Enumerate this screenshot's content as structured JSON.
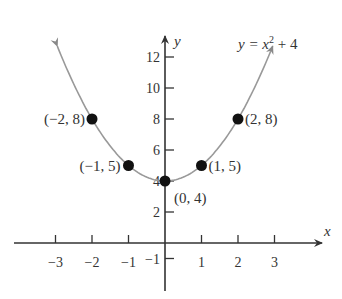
{
  "chart_data": {
    "type": "line",
    "title": "",
    "equation": "y = x^2 + 4",
    "equation_parts": {
      "lhs": "y",
      "eq": "=",
      "var": "x",
      "exp": "2",
      "rest": "+ 4"
    },
    "xlabel": "x",
    "ylabel": "y",
    "xlim": [
      -3.5,
      3.5
    ],
    "ylim": [
      -1.5,
      13
    ],
    "x_ticks": [
      -3,
      -2,
      -1,
      1,
      2,
      3
    ],
    "x_tick_labels": [
      "−3",
      "−2",
      "−1",
      "1",
      "2",
      "3"
    ],
    "y_ticks": [
      -1,
      2,
      4,
      6,
      8,
      10,
      12
    ],
    "y_tick_labels": [
      "−1",
      "2",
      "4",
      "6",
      "8",
      "10",
      "12"
    ],
    "grid": false,
    "points": [
      {
        "x": -2,
        "y": 8,
        "label": "(−2, 8)"
      },
      {
        "x": -1,
        "y": 5,
        "label": "(−1, 5)"
      },
      {
        "x": 0,
        "y": 4,
        "label": "(0, 4)"
      },
      {
        "x": 1,
        "y": 5,
        "label": "(1, 5)"
      },
      {
        "x": 2,
        "y": 8,
        "label": "(2, 8)"
      }
    ],
    "curve": {
      "function": "x^2 + 4",
      "x_range": [
        -2.95,
        2.95
      ],
      "arrows_both_ends": true
    }
  }
}
